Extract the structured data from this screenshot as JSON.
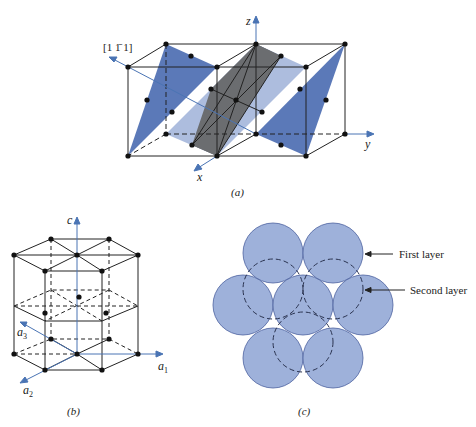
{
  "figure_a": {
    "caption": "(a)",
    "direction_label": "[1 1̄ 1]",
    "axes": {
      "x": "x",
      "y": "y",
      "z": "z"
    }
  },
  "figure_b": {
    "caption": "(b)",
    "axes": {
      "c": "c",
      "a1": "a",
      "a1_sub": "1",
      "a2": "a",
      "a2_sub": "2",
      "a3": "a",
      "a3_sub": "3"
    }
  },
  "figure_c": {
    "caption": "(c)",
    "labels": {
      "first_layer": "First layer",
      "second_layer": "Second layer"
    }
  },
  "colors": {
    "plane_blue": "#5b79b8",
    "plane_light_blue": "#a9b9dc",
    "plane_gray": "#6b6d70",
    "axis_blue": "#4a74b4",
    "sphere_fill": "#9eb1da",
    "sphere_stroke": "#4c62a0",
    "line": "#222222"
  }
}
